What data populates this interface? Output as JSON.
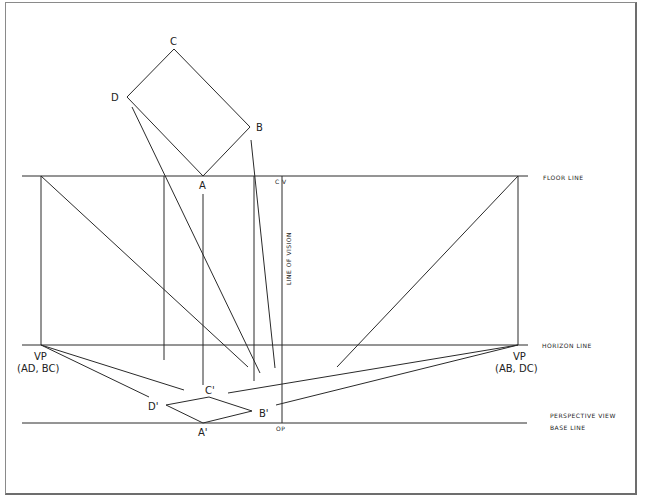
{
  "diagram": {
    "points": {
      "plan": {
        "A": {
          "label": "A",
          "x": 203,
          "y": 176
        },
        "B": {
          "label": "B",
          "x": 250,
          "y": 127
        },
        "C": {
          "label": "C",
          "x": 174,
          "y": 49
        },
        "D": {
          "label": "D",
          "x": 127,
          "y": 97
        }
      },
      "perspective": {
        "A_prime": {
          "label": "A'",
          "x": 203,
          "y": 423
        },
        "B_prime": {
          "label": "B'",
          "x": 252,
          "y": 411
        },
        "C_prime": {
          "label": "C'",
          "x": 209,
          "y": 397
        },
        "D_prime": {
          "label": "D'",
          "x": 166,
          "y": 405
        }
      },
      "vp_left": {
        "x": 41,
        "y": 345
      },
      "vp_right": {
        "x": 518,
        "y": 345
      },
      "cv": {
        "x": 282,
        "y": 176
      },
      "op": {
        "x": 282,
        "y": 423
      }
    },
    "labels": {
      "A": "A",
      "B": "B",
      "C": "C",
      "D": "D",
      "A_prime": "A'",
      "B_prime": "B'",
      "C_prime": "C'",
      "D_prime": "D'",
      "cv": "C V",
      "op": "OP",
      "line_of_vision": "LINE OF VISION",
      "vp_left_title": "VP",
      "vp_left_sub": "(AD, BC)",
      "vp_right_title": "VP",
      "vp_right_sub": "(AB, DC)",
      "floor_line": "FLOOR LINE",
      "horizon_line": "HORIZON LINE",
      "perspective_view": "PERSPECTIVE VIEW",
      "base_line": "BASE LINE"
    },
    "lines": {
      "floor_line_y": 176,
      "horizon_line_y": 345,
      "base_line_y": 423
    }
  }
}
